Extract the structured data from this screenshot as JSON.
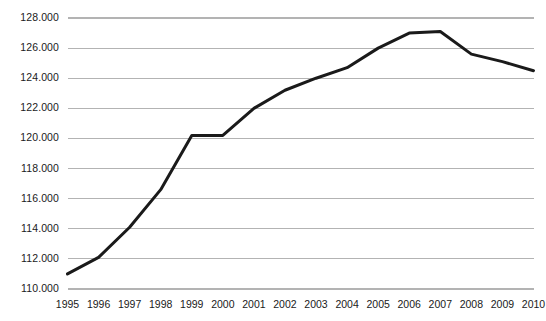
{
  "chart_data": {
    "type": "line",
    "title": "",
    "subtitle": "",
    "xlabel": "",
    "ylabel": "",
    "categories": [
      "1995",
      "1996",
      "1997",
      "1998",
      "1999",
      "2000",
      "2001",
      "2002",
      "2003",
      "2004",
      "2005",
      "2006",
      "2007",
      "2008",
      "2009",
      "2010"
    ],
    "x": [
      1995,
      1996,
      1997,
      1998,
      1999,
      2000,
      2001,
      2002,
      2003,
      2004,
      2005,
      2006,
      2007,
      2008,
      2009,
      2010
    ],
    "values": [
      111.0,
      112.1,
      114.1,
      116.6,
      120.2,
      120.2,
      122.0,
      123.2,
      124.0,
      124.7,
      126.0,
      127.0,
      127.1,
      125.6,
      125.1,
      124.5
    ],
    "series": [
      {
        "name": "",
        "values": [
          111.0,
          112.1,
          114.1,
          116.6,
          120.2,
          120.2,
          122.0,
          123.2,
          124.0,
          124.7,
          126.0,
          127.0,
          127.1,
          125.6,
          125.1,
          124.5
        ]
      }
    ],
    "ylim": [
      110.0,
      128.0
    ],
    "xlim": [
      1995,
      2010
    ],
    "y_ticks": [
      110.0,
      112.0,
      114.0,
      116.0,
      118.0,
      120.0,
      122.0,
      124.0,
      126.0,
      128.0
    ],
    "y_tick_labels": [
      "110.000",
      "112.000",
      "114.000",
      "116.000",
      "118.000",
      "120.000",
      "122.000",
      "124.000",
      "126.000",
      "128.000"
    ],
    "x_tick_labels": [
      "1995",
      "1996",
      "1997",
      "1998",
      "1999",
      "2000",
      "2001",
      "2002",
      "2003",
      "2004",
      "2005",
      "2006",
      "2007",
      "2008",
      "2009",
      "2010"
    ],
    "grid": "horizontal",
    "grid_color": "#b3b3b3",
    "line_color": "#1a1a1a",
    "line_width": 3,
    "legend": "none",
    "legend_position": "none",
    "annotations": [],
    "background_color": "#ffffff",
    "thousands_separator": "."
  },
  "axis": {
    "y_label_color": "#1a1a1a",
    "x_label_color": "#1a1a1a"
  }
}
